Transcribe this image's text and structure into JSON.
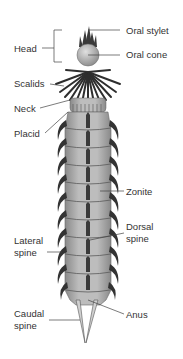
{
  "diagram": {
    "colors": {
      "body": "#b5b5b5",
      "body_dark": "#7a7a7a",
      "spine": "#333333",
      "segment_line": "#555555",
      "leader_line": "#444444",
      "label_text": "#333333"
    },
    "labels": {
      "oral_stylet": "Oral stylet",
      "head": "Head",
      "oral_cone": "Oral cone",
      "scalids": "Scalids",
      "neck": "Neck",
      "placid": "Placid",
      "zonite": "Zonite",
      "dorsal_spine_1": "Dorsal",
      "dorsal_spine_2": "spine",
      "lateral_spine_1": "Lateral",
      "lateral_spine_2": "spine",
      "caudal_spine_1": "Caudal",
      "caudal_spine_2": "spine",
      "anus": "Anus"
    }
  }
}
